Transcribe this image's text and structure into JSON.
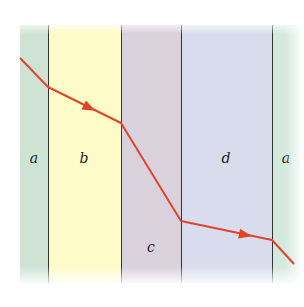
{
  "diagram": {
    "layers": [
      {
        "label": "a",
        "left": 20,
        "right": 48,
        "color": "#cfe3d5"
      },
      {
        "label": "b",
        "left": 48,
        "right": 121,
        "color": "#fdfbc8"
      },
      {
        "label": "c",
        "left": 121,
        "right": 181,
        "color": "#d9d1dc"
      },
      {
        "label": "d",
        "left": 181,
        "right": 272,
        "color": "#d9dcec"
      },
      {
        "label": "a",
        "left": 272,
        "right": 300,
        "color": "#d3e9dd"
      }
    ],
    "labels": [
      {
        "text": "a",
        "x": 34,
        "y": 158
      },
      {
        "text": "b",
        "x": 84,
        "y": 158
      },
      {
        "text": "c",
        "x": 151,
        "y": 247
      },
      {
        "text": "d",
        "x": 226,
        "y": 158
      },
      {
        "text": "a",
        "x": 286,
        "y": 158
      }
    ],
    "ray": {
      "color": "#e0452a",
      "points": [
        [
          20,
          58
        ],
        [
          48,
          87
        ],
        [
          121,
          123
        ],
        [
          181,
          221
        ],
        [
          272,
          240
        ],
        [
          294,
          264
        ]
      ],
      "arrows": [
        [
          90,
          108
        ],
        [
          246,
          235
        ]
      ]
    }
  }
}
